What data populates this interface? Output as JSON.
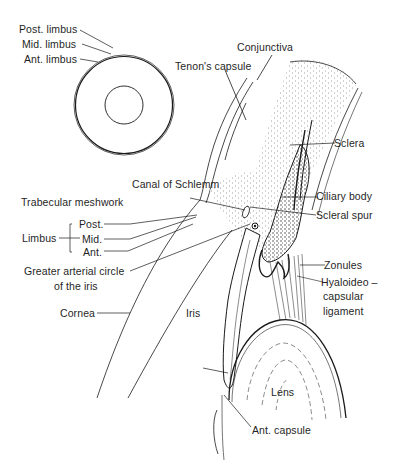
{
  "diagram": {
    "type": "anatomical-illustration",
    "inset": {
      "labels": {
        "post_limbus": "Post. limbus",
        "mid_limbus": "Mid. limbus",
        "ant_limbus": "Ant. limbus"
      }
    },
    "labels": {
      "conjunctiva": "Conjunctiva",
      "tenons_capsule": "Tenon's capsule",
      "sclera": "Sclera",
      "canal_of_schlemm": "Canal of Schlemm",
      "trabecular_meshwork": "Trabecular meshwork",
      "ciliary_body": "Ciliary body",
      "scleral_spur": "Scleral spur",
      "limbus": "Limbus",
      "limbus_post": "Post.",
      "limbus_mid": "Mid.",
      "limbus_ant": "Ant.",
      "greater_arterial_circle_line1": "Greater arterial circle",
      "greater_arterial_circle_line2": "of the iris",
      "zonules": "Zonules",
      "hyaloideo_line1": "Hyaloideo –",
      "hyaloideo_line2": "capsular",
      "hyaloideo_line3": "ligament",
      "cornea": "Cornea",
      "iris": "Iris",
      "lens": "Lens",
      "ant_capsule": "Ant. capsule"
    },
    "colors": {
      "ink": "#1a1a1a",
      "background": "#ffffff",
      "stipple": "#8a8a8a"
    }
  }
}
